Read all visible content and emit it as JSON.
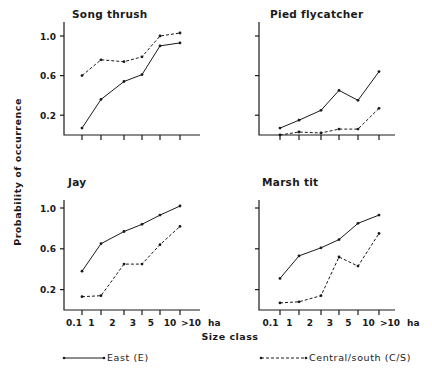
{
  "figure": {
    "ylabel": "Probability of occurrence",
    "xlabel": "Size class",
    "x_unit": "ha",
    "legend": [
      {
        "key": "east",
        "label": "East (E)",
        "style": "solid"
      },
      {
        "key": "cs",
        "label": "Central/south (C/S)",
        "style": "dashed"
      }
    ]
  },
  "chart_data": [
    {
      "type": "line",
      "title": "Song thrush",
      "categories": [
        "0.1",
        "1",
        "2",
        "3",
        "5",
        "10",
        ">10"
      ],
      "xlabel": "Size class (ha)",
      "ylabel": "Probability of occurrence",
      "yticks": [
        0.2,
        0.6,
        1.0
      ],
      "ylim": [
        0,
        1.1
      ],
      "series": [
        {
          "name": "East (E)",
          "values": [
            0.07,
            0.36,
            0.54,
            0.61,
            0.9,
            0.93
          ]
        },
        {
          "name": "Central/south (C/S)",
          "values": [
            0.6,
            0.76,
            0.74,
            0.79,
            1.0,
            1.03
          ]
        }
      ]
    },
    {
      "type": "line",
      "title": "Pied flycatcher",
      "categories": [
        "0.1",
        "1",
        "2",
        "3",
        "5",
        "10",
        ">10"
      ],
      "xlabel": "Size class (ha)",
      "ylabel": "Probability of occurrence",
      "yticks": [
        0.2,
        0.6,
        1.0
      ],
      "ylim": [
        0,
        1.1
      ],
      "series": [
        {
          "name": "East (E)",
          "values": [
            0.07,
            0.15,
            0.25,
            0.45,
            0.35,
            0.64
          ]
        },
        {
          "name": "Central/south (C/S)",
          "values": [
            0.0,
            0.03,
            0.02,
            0.06,
            0.06,
            0.27
          ]
        }
      ]
    },
    {
      "type": "line",
      "title": "Jay",
      "categories": [
        "0.1",
        "1",
        "2",
        "3",
        "5",
        "10",
        ">10"
      ],
      "xlabel": "Size class (ha)",
      "ylabel": "Probability of occurrence",
      "yticks": [
        0.2,
        0.6,
        1.0
      ],
      "ylim": [
        0,
        1.1
      ],
      "series": [
        {
          "name": "East (E)",
          "values": [
            0.38,
            0.65,
            0.77,
            0.84,
            0.93,
            1.02
          ]
        },
        {
          "name": "Central/south (C/S)",
          "values": [
            0.13,
            0.14,
            0.45,
            0.45,
            0.64,
            0.82
          ]
        }
      ]
    },
    {
      "type": "line",
      "title": "Marsh tit",
      "categories": [
        "0.1",
        "1",
        "2",
        "3",
        "5",
        "10",
        ">10"
      ],
      "xlabel": "Size class (ha)",
      "ylabel": "Probability of occurrence",
      "yticks": [
        0.2,
        0.6,
        1.0
      ],
      "ylim": [
        0,
        1.1
      ],
      "series": [
        {
          "name": "East (E)",
          "values": [
            0.31,
            0.53,
            0.61,
            0.69,
            0.85,
            0.93
          ]
        },
        {
          "name": "Central/south (C/S)",
          "values": [
            0.07,
            0.08,
            0.14,
            0.52,
            0.43,
            0.75
          ]
        }
      ]
    }
  ]
}
